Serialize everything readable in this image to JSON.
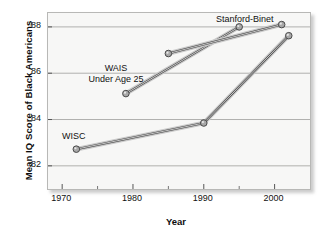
{
  "chart_data": {
    "type": "line",
    "title": "",
    "xlabel": "Year",
    "ylabel": "Mean IQ Score of Black Americans",
    "xlim": [
      1968,
      2005
    ],
    "ylim": [
      81.0,
      88.6
    ],
    "xticks": [
      1970,
      1980,
      1990,
      2000
    ],
    "xtick_labels": [
      "1970",
      "1980",
      "1990",
      "2000"
    ],
    "xminor_ticks": [
      1975,
      1985,
      1995
    ],
    "yticks": [
      82,
      84,
      86,
      88
    ],
    "ytick_labels": [
      "82",
      "84",
      "86",
      "88"
    ],
    "grid": "horizontal",
    "legend": "inline-labels",
    "series": [
      {
        "name": "WISC",
        "label": "WISC",
        "x": [
          1972,
          1990,
          2002
        ],
        "y": [
          82.72,
          83.85,
          87.62
        ]
      },
      {
        "name": "WAIS Under Age 25",
        "label": "WAIS\nUnder Age 25",
        "x": [
          1979,
          1995
        ],
        "y": [
          85.12,
          88.0
        ]
      },
      {
        "name": "Stanford-Binet",
        "label": "Stanford-Binet",
        "x": [
          1985,
          2001
        ],
        "y": [
          86.85,
          88.1
        ]
      }
    ],
    "colors": {
      "line_dark": "#4a4a4a",
      "line_light": "#c9c9c9",
      "marker_fill": "#a8a8a8",
      "marker_edge": "#4a4a4a",
      "plot_background": "#f7f7f6",
      "grid": "#b0b0ae",
      "frame": "#b8b8b6",
      "text": "#111111"
    }
  },
  "labels": {
    "y_axis_title": "Mean IQ Score of Black Americans",
    "x_axis_title": "Year",
    "wisc": "WISC",
    "wais_line1": "WAIS",
    "wais_line2": "Under Age 25",
    "stanford_binet": "Stanford-Binet"
  }
}
